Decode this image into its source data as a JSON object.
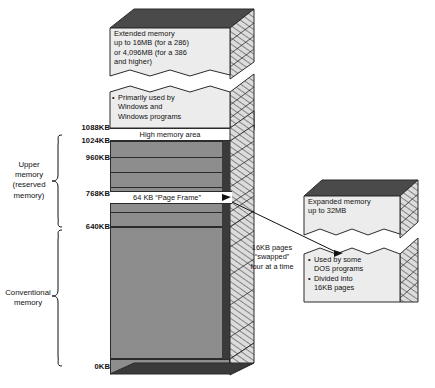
{
  "diagram": {
    "colors": {
      "column_face": "#8d8d8d",
      "outline": "#2b2b2b",
      "light_face": "#ececec",
      "hatch_side": "#d8d8d8"
    }
  },
  "blocks": {
    "extended_memory": {
      "lines": [
        "Extended memory",
        "up to 16MB (for a 286)",
        "or 4,096MB (for a 386",
        "and higher)"
      ]
    },
    "windows_usage": {
      "bullet": "•",
      "lines": [
        "Primarily used by",
        "Windows and",
        "Windows programs"
      ]
    },
    "high_memory_area": {
      "label": "High memory area"
    },
    "page_frame": {
      "label": "64 KB “Page Frame”"
    },
    "dos_loads": {
      "label": "DOS loads here"
    },
    "expanded_memory": {
      "lines": [
        "Expanded memory",
        "up to 32MB"
      ]
    },
    "expanded_notes": {
      "bullet": "•",
      "items": [
        [
          "Used by some",
          "DOS programs"
        ],
        [
          "Divided into",
          "16KB pages"
        ]
      ]
    },
    "swap_note": {
      "lines": [
        "16KB pages",
        "“swapped”",
        "four at a time"
      ]
    }
  },
  "ticks": [
    {
      "label": "1088KB"
    },
    {
      "label": "1024KB"
    },
    {
      "label": "960KB"
    },
    {
      "label": "768KB"
    },
    {
      "label": "640KB"
    },
    {
      "label": "0KB"
    }
  ],
  "regions": [
    {
      "lines": [
        "Upper",
        "memory",
        "(reserved",
        "memory)"
      ]
    },
    {
      "lines": [
        "Conventional",
        "memory"
      ]
    }
  ]
}
